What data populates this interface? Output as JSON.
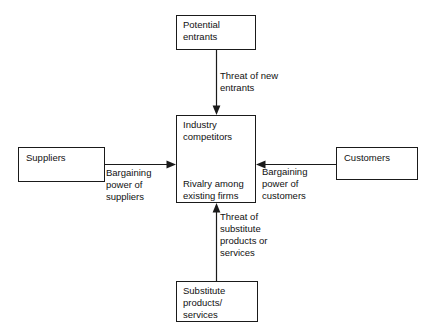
{
  "diagram": {
    "stroke_color": "#1a1a1a",
    "text_color": "#111111",
    "background_color": "#ffffff",
    "nodes": {
      "potential_entrants": {
        "label": "Potential\nentrants",
        "x": 176,
        "y": 15,
        "w": 80,
        "h": 35
      },
      "industry_competitors": {
        "title": "Industry\ncompetitors",
        "subtitle": "Rivalry among\nexisting firms",
        "x": 176,
        "y": 115,
        "w": 80,
        "h": 88
      },
      "suppliers": {
        "label": "Suppliers",
        "x": 18,
        "y": 147,
        "w": 87,
        "h": 35
      },
      "customers": {
        "label": "Customers",
        "x": 336,
        "y": 147,
        "w": 82,
        "h": 33
      },
      "substitutes": {
        "label": "Substitute\nproducts/\nservices",
        "x": 176,
        "y": 281,
        "w": 82,
        "h": 41
      }
    },
    "edges": {
      "threat_of_new_entrants": {
        "label": "Threat of new\nentrants",
        "label_x": 220,
        "label_y": 70
      },
      "bargaining_power_of_suppliers": {
        "label": "Bargaining\npower of\nsuppliers",
        "label_x": 106,
        "label_y": 167
      },
      "bargaining_power_of_customers": {
        "label": "Bargaining\npower of\ncustomers",
        "label_x": 262,
        "label_y": 166
      },
      "threat_of_substitutes": {
        "label": "Threat of\nsubstitute\nproducts or\nservices",
        "label_x": 220,
        "label_y": 211
      }
    },
    "rivalry_icon_name": "circular-rivalry-arrow-icon"
  }
}
